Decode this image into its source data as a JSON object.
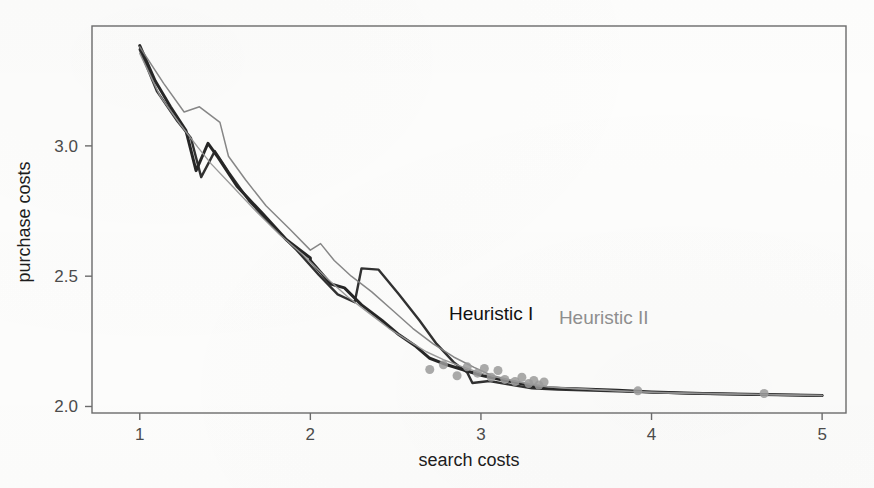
{
  "figure": {
    "background_color": "#fdfdfc",
    "frame_color": "#6b6b6b"
  },
  "chart_data": {
    "type": "line",
    "title": "",
    "xlabel": "search costs",
    "ylabel": "purchase costs",
    "xlim": [
      0.72,
      5.14
    ],
    "ylim": [
      1.975,
      3.46
    ],
    "xticks": [
      1,
      2,
      3,
      4,
      5
    ],
    "xticklabels": [
      "1",
      "2",
      "3",
      "4",
      "5"
    ],
    "yticks": [
      2.0,
      2.5,
      3.0
    ],
    "yticklabels": [
      "2.0",
      "2.5",
      "3.0"
    ],
    "grid": false,
    "legend": {
      "position": "inside-center",
      "entries": [
        {
          "label": "Heuristic I",
          "color": "#111111"
        },
        {
          "label": "Heuristic II",
          "color": "#8e8e8e"
        }
      ]
    },
    "marker": {
      "shape": "circle",
      "color": "#9a9a9a",
      "size_px": 9
    },
    "series": [
      {
        "name": "Heuristic I",
        "color": "#1a1a1a",
        "width": 3.0,
        "run": "a",
        "points": [
          [
            1.0,
            3.385
          ],
          [
            1.09,
            3.25
          ],
          [
            1.18,
            3.15
          ],
          [
            1.27,
            3.06
          ],
          [
            1.33,
            2.905
          ],
          [
            1.4,
            3.01
          ],
          [
            1.46,
            2.955
          ],
          [
            1.57,
            2.845
          ],
          [
            1.72,
            2.74
          ],
          [
            1.86,
            2.64
          ],
          [
            2.0,
            2.57
          ],
          [
            2.0,
            2.56
          ],
          [
            2.12,
            2.47
          ],
          [
            2.2,
            2.455
          ],
          [
            2.3,
            2.39
          ],
          [
            2.42,
            2.33
          ],
          [
            2.52,
            2.275
          ],
          [
            2.62,
            2.23
          ],
          [
            2.7,
            2.185
          ],
          [
            2.8,
            2.16
          ],
          [
            2.9,
            2.14
          ],
          [
            3.0,
            2.12
          ],
          [
            3.1,
            2.105
          ],
          [
            3.22,
            2.09
          ],
          [
            3.34,
            2.072
          ],
          [
            3.55,
            2.068
          ],
          [
            3.8,
            2.062
          ],
          [
            4.0,
            2.056
          ],
          [
            4.3,
            2.05
          ],
          [
            4.65,
            2.046
          ],
          [
            5.0,
            2.042
          ]
        ]
      },
      {
        "name": "Heuristic I",
        "color": "#262626",
        "width": 2.4,
        "run": "b",
        "points": [
          [
            1.0,
            3.37
          ],
          [
            1.1,
            3.21
          ],
          [
            1.22,
            3.095
          ],
          [
            1.3,
            3.03
          ],
          [
            1.36,
            2.88
          ],
          [
            1.44,
            2.98
          ],
          [
            1.52,
            2.9
          ],
          [
            1.64,
            2.79
          ],
          [
            1.78,
            2.69
          ],
          [
            1.92,
            2.6
          ],
          [
            2.05,
            2.505
          ],
          [
            2.16,
            2.43
          ],
          [
            2.26,
            2.4
          ],
          [
            2.3,
            2.53
          ],
          [
            2.4,
            2.525
          ],
          [
            2.52,
            2.43
          ],
          [
            2.64,
            2.33
          ],
          [
            2.74,
            2.24
          ],
          [
            2.84,
            2.17
          ],
          [
            2.92,
            2.13
          ],
          [
            2.95,
            2.09
          ],
          [
            3.05,
            2.098
          ],
          [
            3.16,
            2.085
          ],
          [
            3.3,
            2.07
          ],
          [
            3.45,
            2.065
          ],
          [
            3.7,
            2.06
          ],
          [
            3.95,
            2.055
          ],
          [
            4.25,
            2.05
          ],
          [
            4.6,
            2.046
          ],
          [
            5.0,
            2.042
          ]
        ]
      },
      {
        "name": "Heuristic II",
        "color": "#808080",
        "width": 1.5,
        "run": "a",
        "points": [
          [
            1.0,
            3.38
          ],
          [
            1.14,
            3.24
          ],
          [
            1.26,
            3.13
          ],
          [
            1.35,
            3.15
          ],
          [
            1.47,
            3.09
          ],
          [
            1.52,
            2.96
          ],
          [
            1.62,
            2.87
          ],
          [
            1.74,
            2.77
          ],
          [
            1.88,
            2.68
          ],
          [
            2.0,
            2.6
          ],
          [
            2.06,
            2.625
          ],
          [
            2.14,
            2.56
          ],
          [
            2.24,
            2.5
          ],
          [
            2.36,
            2.44
          ],
          [
            2.48,
            2.37
          ],
          [
            2.6,
            2.3
          ],
          [
            2.72,
            2.24
          ],
          [
            2.84,
            2.19
          ],
          [
            2.96,
            2.15
          ],
          [
            3.06,
            2.12
          ],
          [
            3.18,
            2.1
          ],
          [
            3.32,
            2.08
          ],
          [
            3.5,
            2.07
          ],
          [
            3.75,
            2.062
          ],
          [
            4.0,
            2.055
          ],
          [
            4.35,
            2.05
          ],
          [
            4.7,
            2.045
          ],
          [
            5.0,
            2.042
          ]
        ]
      },
      {
        "name": "Heuristic II",
        "color": "#959595",
        "width": 1.4,
        "run": "b",
        "points": [
          [
            1.0,
            3.355
          ],
          [
            1.12,
            3.19
          ],
          [
            1.24,
            3.08
          ],
          [
            1.34,
            2.995
          ],
          [
            1.42,
            2.93
          ],
          [
            1.55,
            2.84
          ],
          [
            1.68,
            2.75
          ],
          [
            1.82,
            2.66
          ],
          [
            1.96,
            2.58
          ],
          [
            2.1,
            2.49
          ],
          [
            2.22,
            2.42
          ],
          [
            2.34,
            2.36
          ],
          [
            2.46,
            2.3
          ],
          [
            2.58,
            2.25
          ],
          [
            2.68,
            2.21
          ],
          [
            2.78,
            2.18
          ],
          [
            2.88,
            2.155
          ],
          [
            3.0,
            2.128
          ],
          [
            3.12,
            2.108
          ],
          [
            3.26,
            2.09
          ],
          [
            3.4,
            2.075
          ],
          [
            3.62,
            2.066
          ],
          [
            3.85,
            2.058
          ],
          [
            4.1,
            2.052
          ],
          [
            4.45,
            2.048
          ],
          [
            4.8,
            2.044
          ],
          [
            5.0,
            2.042
          ]
        ]
      }
    ],
    "markers": [
      [
        2.7,
        2.142
      ],
      [
        2.78,
        2.16
      ],
      [
        2.86,
        2.118
      ],
      [
        2.92,
        2.152
      ],
      [
        2.98,
        2.128
      ],
      [
        3.02,
        2.146
      ],
      [
        3.06,
        2.112
      ],
      [
        3.1,
        2.138
      ],
      [
        3.14,
        2.104
      ],
      [
        3.2,
        2.096
      ],
      [
        3.24,
        2.112
      ],
      [
        3.28,
        2.088
      ],
      [
        3.31,
        2.1
      ],
      [
        3.34,
        2.082
      ],
      [
        3.37,
        2.094
      ],
      [
        3.92,
        2.06
      ],
      [
        4.66,
        2.05
      ]
    ],
    "annotations": [
      {
        "text": "Heuristic I",
        "x": 3.06,
        "y": 2.33,
        "color": "#111111"
      },
      {
        "text": "Heuristic II",
        "x": 3.72,
        "y": 2.315,
        "color": "#8e8e8e"
      }
    ]
  }
}
